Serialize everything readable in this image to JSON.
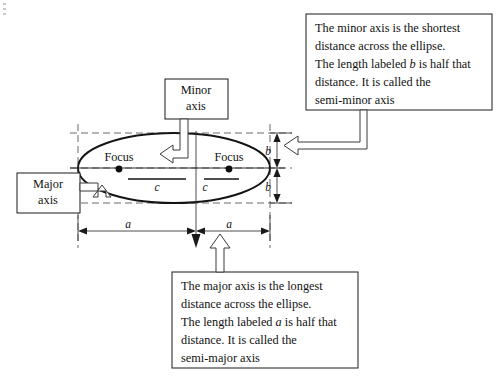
{
  "figure": {
    "type": "ellipse-geometry-diagram",
    "callouts": [
      {
        "id": "minor-axis-callout",
        "lines": [
          "The minor axis is the shortest",
          "distance across the ellipse.",
          "The length labeled b is half that",
          "distance. It is called the",
          "semi-minor axis"
        ],
        "line3_pre": "The length labeled ",
        "line3_var": "b",
        "line3_post": " is half that"
      },
      {
        "id": "major-axis-callout",
        "lines": [
          "The major axis is the longest",
          "distance across the ellipse.",
          "The length labeled a is half that",
          "distance. It is called the",
          "semi-major axis"
        ],
        "line3_pre": "The length labeled ",
        "line3_var": "a",
        "line3_post": " is half that"
      }
    ],
    "labels": {
      "minor_axis_line1": "Minor",
      "minor_axis_line2": "axis",
      "major_axis_line1": "Major",
      "major_axis_line2": "axis",
      "focus_left": "Focus",
      "focus_right": "Focus"
    },
    "dimensions": {
      "semi_minor_upper": "b",
      "semi_minor_lower": "b",
      "semi_major_left": "a",
      "semi_major_right": "a",
      "focal_left": "c",
      "focal_right": "c"
    },
    "colors": {
      "ink": "#141414",
      "dashed": "#5a5a5a",
      "background": "#ffffff"
    }
  }
}
